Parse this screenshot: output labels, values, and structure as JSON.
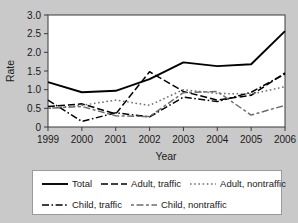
{
  "chart_data": {
    "type": "line",
    "title": "",
    "xlabel": "Year",
    "ylabel": "Rate",
    "x": [
      1999,
      2000,
      2001,
      2002,
      2003,
      2004,
      2005,
      2006
    ],
    "categories": [
      "1999",
      "2000",
      "2001",
      "2002",
      "2003",
      "2004",
      "2005",
      "2006"
    ],
    "xtick_labels": [
      "1999",
      "2000",
      "2001",
      "2002",
      "2003",
      "2004",
      "2005",
      "2006"
    ],
    "ytick_labels": [
      "0",
      "0.5",
      "1.0",
      "1.5",
      "2.0",
      "2.5",
      "3.0"
    ],
    "ytick_values": [
      0,
      0.5,
      1.0,
      1.5,
      2.0,
      2.5,
      3.0
    ],
    "ylim": [
      0,
      3.0
    ],
    "xlim": [
      1999,
      2006
    ],
    "grid": false,
    "legend_position": "bottom",
    "series": [
      {
        "name": "Total",
        "style": "solid",
        "color": "#000000",
        "values": [
          1.2,
          0.93,
          0.97,
          1.28,
          1.73,
          1.63,
          1.68,
          2.57
        ]
      },
      {
        "name": "Adult, traffic",
        "style": "dashed",
        "color": "#000000",
        "values": [
          0.55,
          0.62,
          0.35,
          1.48,
          0.95,
          0.72,
          0.85,
          1.45
        ]
      },
      {
        "name": "Adult, nontraffic",
        "style": "dotted",
        "color": "#6e6e6e",
        "values": [
          0.5,
          0.58,
          0.72,
          0.58,
          1.0,
          0.9,
          0.88,
          1.08
        ]
      },
      {
        "name": "Child, traffic",
        "style": "dash-dot",
        "color": "#000000",
        "values": [
          0.72,
          0.15,
          0.38,
          0.27,
          0.8,
          0.68,
          0.93,
          1.42
        ]
      },
      {
        "name": "Child, nontraffic",
        "style": "dash-dash",
        "color": "#6e6e6e",
        "values": [
          0.5,
          0.55,
          0.3,
          0.28,
          0.92,
          0.95,
          0.32,
          0.58
        ]
      }
    ]
  },
  "legend": {
    "items": [
      {
        "label": "Total"
      },
      {
        "label": "Adult, traffic"
      },
      {
        "label": "Adult, nontraffic"
      },
      {
        "label": "Child, traffic"
      },
      {
        "label": "Child, nontraffic"
      }
    ]
  }
}
